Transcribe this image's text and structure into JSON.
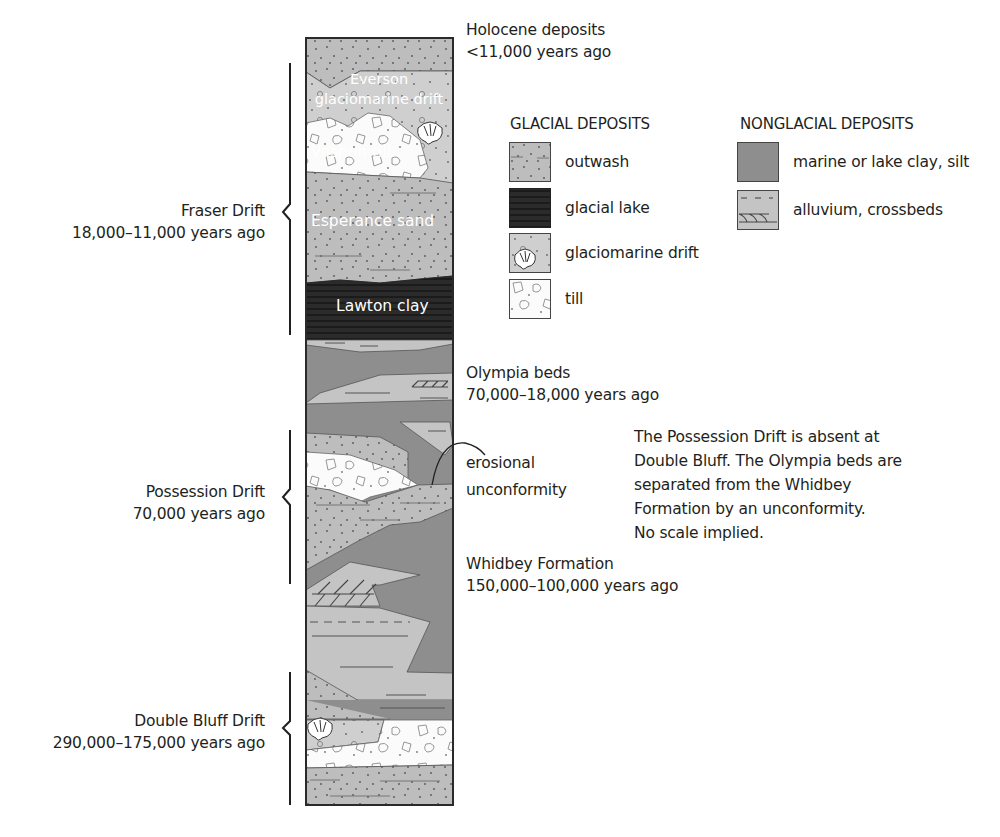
{
  "column": {
    "labels": {
      "everson_1": "Everson",
      "everson_2": "glaciomarine drift",
      "vashon": "Vashon till",
      "esperance": "Esperance sand",
      "lawton": "Lawton clay"
    }
  },
  "right_labels": {
    "holocene": {
      "name": "Holocene deposits",
      "age": "<11,000 years ago"
    },
    "olympia": {
      "name": "Olympia beds",
      "age": "70,000–18,000 years ago"
    },
    "erosional": {
      "line1": "erosional",
      "line2": "unconformity"
    },
    "whidbey": {
      "name": "Whidbey Formation",
      "age": "150,000–100,000 years ago"
    }
  },
  "left_brackets": [
    {
      "name": "Fraser Drift",
      "age": "18,000–11,000 years ago"
    },
    {
      "name": "Possession Drift",
      "age": "70,000 years ago"
    },
    {
      "name": "Double Bluff Drift",
      "age": "290,000–175,000 years ago"
    }
  ],
  "legend": {
    "glacial": {
      "title": "GLACIAL DEPOSITS",
      "items": [
        {
          "label": "outwash",
          "pattern": "outwash"
        },
        {
          "label": "glacial lake",
          "pattern": "glacial-lake"
        },
        {
          "label": "glaciomarine drift",
          "pattern": "glaciomarine-drift"
        },
        {
          "label": "till",
          "pattern": "till"
        }
      ]
    },
    "nonglacial": {
      "title": "NONGLACIAL DEPOSITS",
      "items": [
        {
          "label": "marine or lake clay, silt",
          "pattern": "marine-clay"
        },
        {
          "label": "alluvium, crossbeds",
          "pattern": "alluvium"
        }
      ]
    }
  },
  "note": {
    "lines": [
      "The Possession Drift is absent at",
      "Double Bluff. The Olympia beds are",
      "separated from the Whidbey",
      "Formation by an unconformity.",
      "No scale implied."
    ]
  },
  "colors": {
    "outwash": "#bdbdbd",
    "glacial_lake": "#2b2b2b",
    "glaciomarine": "#cfcfcf",
    "till": "#fbfbfb",
    "marine_clay": "#8e8e8e",
    "alluvium": "#c4c4c4",
    "outline": "#3a3a3a"
  }
}
